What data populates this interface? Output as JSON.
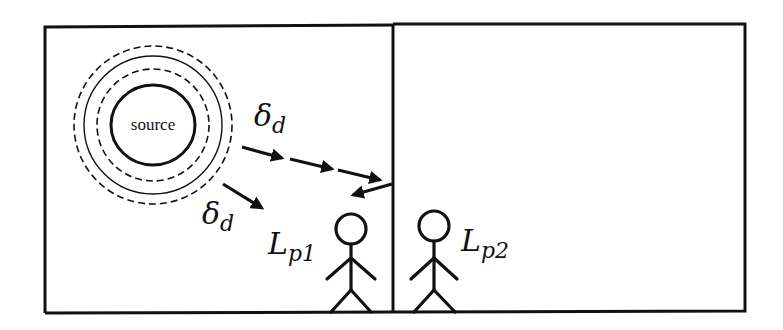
{
  "diagram": {
    "source_label": "source",
    "delta_symbol": "δ",
    "delta_subscript": "d",
    "listener1": {
      "symbol": "L",
      "subscript": "p1"
    },
    "listener2": {
      "symbol": "L",
      "subscript": "p2"
    },
    "colors": {
      "stroke": "#111111",
      "background": "#ffffff"
    }
  }
}
